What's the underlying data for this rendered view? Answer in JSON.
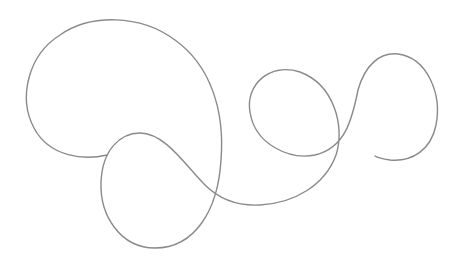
{
  "drawing": {
    "background": "#ffffff",
    "stroke_color": "#8a8a8a",
    "stroke_width": 1.4,
    "path": "M 107 155 C 85 160, 50 158, 34 128 C 18 98, 28 55, 60 35 C 90 14, 140 14, 175 40 C 210 65, 225 110, 221 160 C 218 210, 195 248, 155 248 C 120 248, 100 215, 101 183 C 102 150, 120 133, 140 133 C 165 133, 185 165, 205 185 C 220 200, 240 206, 260 205 C 295 203, 325 185, 336 155 C 345 128, 335 85, 300 72 C 270 62, 245 85, 250 112 C 255 145, 290 160, 315 155 C 345 148, 352 120, 358 90 C 365 65, 380 52, 398 54 C 428 58, 442 95, 436 125 C 431 150, 412 162, 390 160 C 383 159, 378 158, 375 156"
  }
}
